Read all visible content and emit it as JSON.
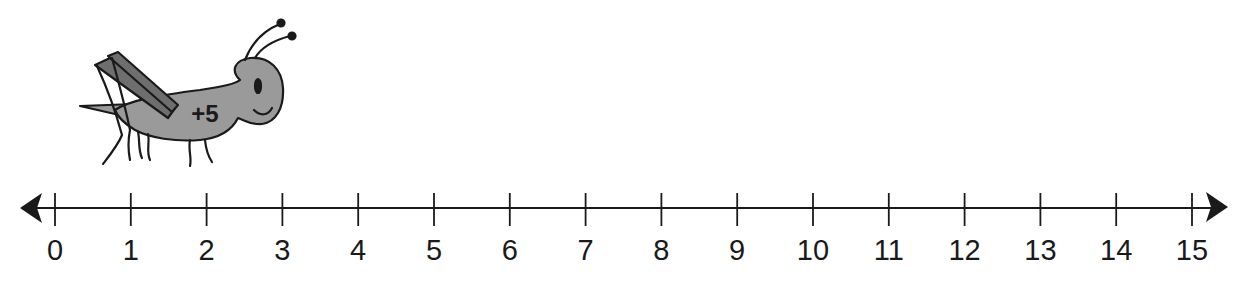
{
  "diagram": {
    "type": "number-line",
    "range": [
      0,
      15
    ],
    "step": 1,
    "ticks": [
      "0",
      "1",
      "2",
      "3",
      "4",
      "5",
      "6",
      "7",
      "8",
      "9",
      "10",
      "11",
      "12",
      "13",
      "14",
      "15"
    ],
    "arrows": [
      "left",
      "right"
    ],
    "character": {
      "name": "grasshopper",
      "label": "+5",
      "position_start": 0
    },
    "colors": {
      "line": "#1a1a1a",
      "body": "#9a9a9a",
      "wings": "#6e6e6e",
      "outline": "#1a1a1a"
    }
  }
}
